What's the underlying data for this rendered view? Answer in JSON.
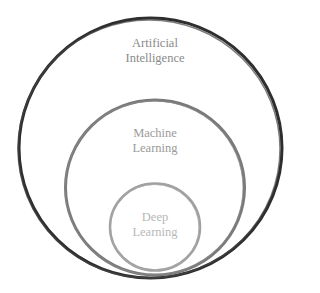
{
  "diagram": {
    "type": "nested-circles",
    "circles": [
      {
        "id": "ai",
        "label_line1": "Artificial",
        "label_line2": "Intelligence",
        "stroke": "#2e2e2e",
        "text_color": "#8a8a8a"
      },
      {
        "id": "ml",
        "label_line1": "Machine",
        "label_line2": "Learning",
        "stroke": "#7a7a7a",
        "text_color": "#9a9a9a"
      },
      {
        "id": "dl",
        "label_line1": "Deep",
        "label_line2": "Learning",
        "stroke": "#a0a0a0",
        "text_color": "#b8b8b8"
      }
    ]
  }
}
